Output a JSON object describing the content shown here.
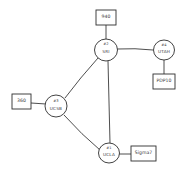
{
  "diagram": {
    "type": "network-topology",
    "nodes": [
      {
        "id": "sri",
        "number": "#2",
        "name": "SRI",
        "host": "940"
      },
      {
        "id": "utah",
        "number": "#4",
        "name": "UTAH",
        "host": "PDP10"
      },
      {
        "id": "ucsb",
        "number": "#3",
        "name": "UCSB",
        "host": "360"
      },
      {
        "id": "ucla",
        "number": "#1",
        "name": "UCLA",
        "host": "Sigma7"
      }
    ],
    "links": [
      [
        "sri",
        "utah"
      ],
      [
        "sri",
        "ucsb"
      ],
      [
        "sri",
        "ucla"
      ],
      [
        "ucsb",
        "ucla"
      ]
    ],
    "colors": {
      "ink": "#2e2e2e",
      "paper": "#ffffff"
    }
  }
}
